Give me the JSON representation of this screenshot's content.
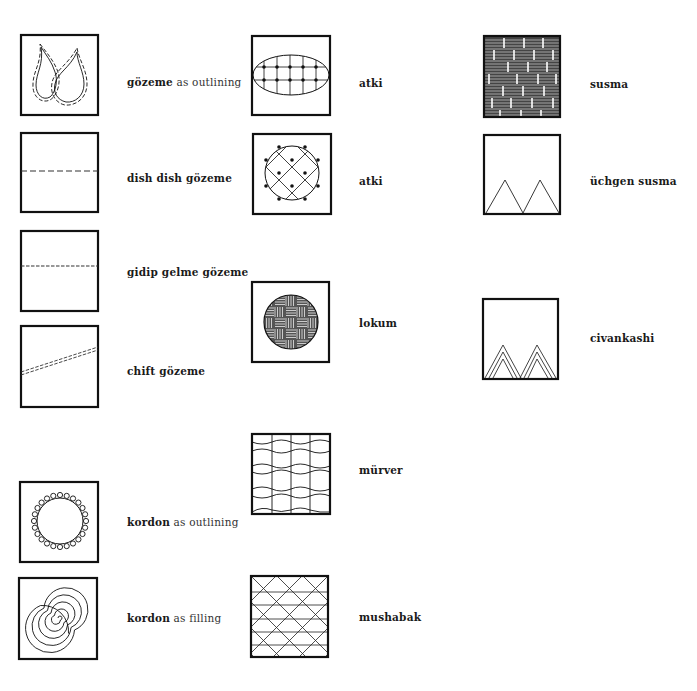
{
  "figure": {
    "columns": [
      {
        "items": [
          {
            "id": "gozeme-outlining",
            "term": "gözeme",
            "suffix": "as outlining",
            "pattern": "dashed-double-flame-outline"
          },
          {
            "id": "dish-dish-gozeme",
            "term": "dish dish gözeme",
            "suffix": "",
            "pattern": "long-dash-horizontal-line"
          },
          {
            "id": "gidip-gelme-gozeme",
            "term": "gidip gelme gözeme",
            "suffix": "",
            "pattern": "short-dash-horizontal-line"
          },
          {
            "id": "chift-gozeme",
            "term": "chift gözeme",
            "suffix": "",
            "pattern": "double-dashed-diagonal-line"
          },
          {
            "id": "kordon-outlining",
            "term": "kordon",
            "suffix": "as outlining",
            "pattern": "looped-circle-outline"
          },
          {
            "id": "kordon-filling",
            "term": "kordon",
            "suffix": "as filling",
            "pattern": "spiral-fill"
          }
        ]
      },
      {
        "items": [
          {
            "id": "atki-1",
            "term": "atki",
            "suffix": "",
            "pattern": "oval-grid-with-knots"
          },
          {
            "id": "atki-2",
            "term": "atki",
            "suffix": "",
            "pattern": "circle-diagonal-lattice-with-knots"
          },
          {
            "id": "lokum",
            "term": "lokum",
            "suffix": "",
            "pattern": "circle-basket-weave"
          },
          {
            "id": "murver",
            "term": "mürver",
            "suffix": "",
            "pattern": "wavy-horizontal-grid"
          },
          {
            "id": "mushabak",
            "term": "mushabak",
            "suffix": "",
            "pattern": "diagonal-lattice-with-horizontals"
          }
        ]
      },
      {
        "items": [
          {
            "id": "susma",
            "term": "susma",
            "suffix": "",
            "pattern": "brick-hatched-fill"
          },
          {
            "id": "uchgen-susma",
            "term": "üchgen susma",
            "suffix": "",
            "pattern": "two-triangles"
          },
          {
            "id": "civankashi",
            "term": "civankashi",
            "suffix": "",
            "pattern": "nested-triangles"
          }
        ]
      }
    ]
  },
  "colors": {
    "ink": "#111111",
    "background": "#ffffff"
  }
}
